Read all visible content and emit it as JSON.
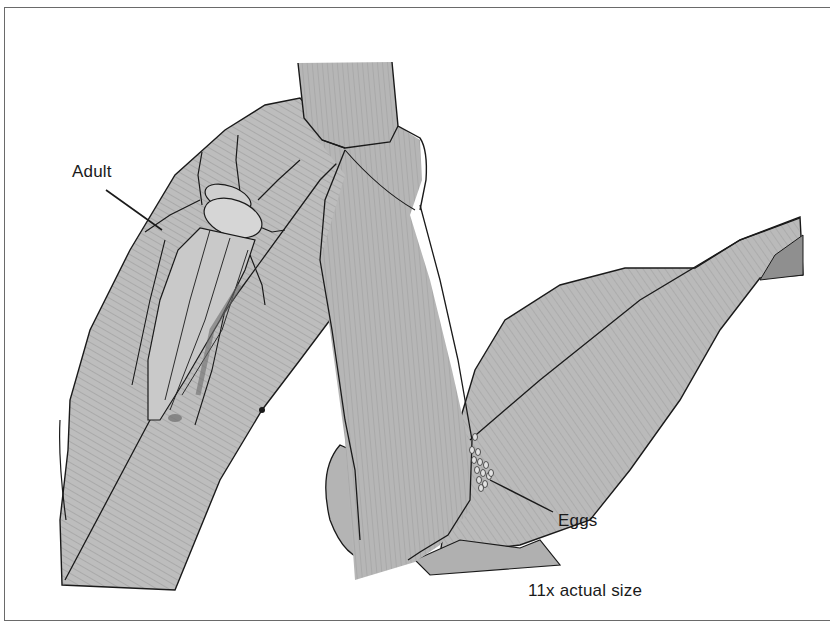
{
  "figure": {
    "labels": {
      "adult": "Adult",
      "eggs": "Eggs",
      "scale": "11x actual size"
    },
    "colors": {
      "leaf_fill": "#b8b8b8",
      "leaf_dark": "#9a9a9a",
      "stalk_fill": "#b3b3b3",
      "outline": "#1a1a1a",
      "frame": "#6a6a6a",
      "background": "#ffffff"
    }
  }
}
